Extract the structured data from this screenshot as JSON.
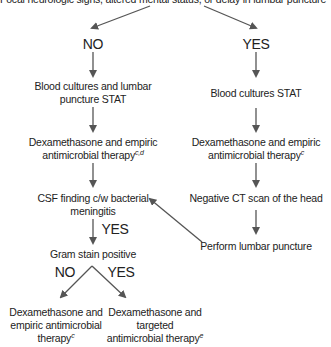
{
  "diagram": {
    "type": "flowchart",
    "root": {
      "text": "Focal neurologic signs, altered mental status, or delay in lumbar puncture"
    },
    "branches": {
      "no": {
        "label": "NO"
      },
      "yes": {
        "label": "YES"
      }
    },
    "left": {
      "step1": {
        "line1": "Blood cultures and lumbar",
        "line2": "puncture STAT"
      },
      "step2": {
        "line1": "Dexamethasone and empiric",
        "line2": "antimicrobial therapy",
        "sup": "c,d"
      },
      "step3": {
        "line1": "CSF finding c/w bacterial",
        "line2": "meningitis"
      },
      "step3_yes": "YES",
      "step4": {
        "text": "Gram stain positive"
      },
      "split_no": "NO",
      "split_yes": "YES",
      "out_no": {
        "line1": "Dexamethasone and",
        "line2": "empiric antimicrobial",
        "line3": "therapy",
        "sup": "c"
      },
      "out_yes": {
        "line1": "Dexamethasone and",
        "line2": "targeted",
        "line3": "antimicrobial therapy",
        "sup": "e"
      }
    },
    "right": {
      "step1": {
        "text": "Blood cultures  STAT"
      },
      "step2": {
        "line1": "Dexamethasone and empiric",
        "line2": "antimicrobial therapy",
        "sup": "c"
      },
      "step3": {
        "text": "Negative CT scan of the head"
      },
      "step4": {
        "text": "Perform lumbar puncture"
      }
    },
    "colors": {
      "text": "#222222",
      "arrow": "#555555",
      "background": "#ffffff"
    }
  }
}
